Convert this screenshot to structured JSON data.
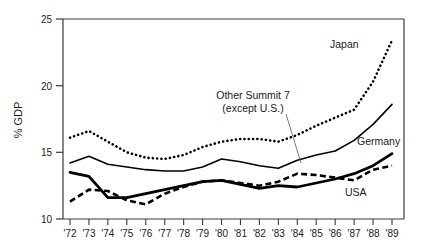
{
  "chart_data": {
    "type": "line",
    "title": "",
    "xlabel": "",
    "ylabel": "% GDP",
    "ylim": [
      10,
      25
    ],
    "yticks": [
      10,
      15,
      20,
      25
    ],
    "ytick_labels": [
      "10",
      "15",
      "20",
      "25"
    ],
    "grid": false,
    "legend": "inline-labels",
    "x": [
      1972,
      1973,
      1974,
      1975,
      1976,
      1977,
      1978,
      1979,
      1980,
      1981,
      1982,
      1983,
      1984,
      1985,
      1986,
      1987,
      1988,
      1989
    ],
    "categories": [
      "'72",
      "'73",
      "'74",
      "'75",
      "'76",
      "'77",
      "'78",
      "'79",
      "'80",
      "'81",
      "'82",
      "'83",
      "'84",
      "'85",
      "'86",
      "'87",
      "'88",
      "'89"
    ],
    "series": [
      {
        "name": "Japan",
        "style": "dotted",
        "label": "Japan",
        "values": [
          16.1,
          16.6,
          15.8,
          15.0,
          14.6,
          14.5,
          14.8,
          15.4,
          15.8,
          16.0,
          16.0,
          15.8,
          16.3,
          17.0,
          17.6,
          18.2,
          20.3,
          23.4
        ]
      },
      {
        "name": "Other Summit 7 (except U.S.)",
        "style": "solid-thin",
        "label": "Other Summit 7\n(except U.S.)",
        "values": [
          14.2,
          14.7,
          14.1,
          13.9,
          13.7,
          13.6,
          13.6,
          13.9,
          14.5,
          14.3,
          14.0,
          13.8,
          14.4,
          14.8,
          15.1,
          15.9,
          17.1,
          18.6
        ]
      },
      {
        "name": "Germany",
        "style": "solid-thick",
        "label": "Germany",
        "values": [
          13.5,
          13.2,
          11.6,
          11.6,
          11.9,
          12.2,
          12.5,
          12.8,
          12.9,
          12.6,
          12.3,
          12.5,
          12.4,
          12.7,
          13.0,
          13.4,
          14.0,
          14.9
        ]
      },
      {
        "name": "USA",
        "style": "dashed",
        "label": "USA",
        "values": [
          11.3,
          12.2,
          12.1,
          11.4,
          11.1,
          11.9,
          12.4,
          12.8,
          12.9,
          12.7,
          12.5,
          12.8,
          13.4,
          13.3,
          13.1,
          12.9,
          13.7,
          14.0
        ]
      }
    ],
    "annotations": [
      {
        "name": "other-summit-7-annotation",
        "line1": "Other Summit 7",
        "line2": "(except U.S.)",
        "leader": true
      }
    ],
    "series_labels": {
      "japan": "Japan",
      "germany": "Germany",
      "usa": "USA"
    },
    "colors": {
      "line": "#000000",
      "axis": "#3a3a3a",
      "text": "#1a1a1a",
      "leader": "#6b6b6b",
      "background": "#ffffff"
    }
  }
}
